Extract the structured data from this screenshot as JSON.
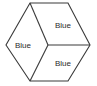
{
  "diagram": {
    "name": "hexagon-three-rhombi",
    "canvas": {
      "width": 97,
      "height": 86
    },
    "background_color": "#ffffff",
    "stroke_color": "#3a3a3a",
    "text_color": "#2b2b2b",
    "outline": {
      "points": "30,3 68,3 90,45 68,81 30,81 6,45",
      "vertices": [
        {
          "name": "top-left",
          "x": 30,
          "y": 3
        },
        {
          "name": "top-right",
          "x": 68,
          "y": 3
        },
        {
          "name": "right",
          "x": 90,
          "y": 45
        },
        {
          "name": "bottom-right",
          "x": 68,
          "y": 81
        },
        {
          "name": "bottom-left",
          "x": 30,
          "y": 81
        },
        {
          "name": "left",
          "x": 6,
          "y": 45
        }
      ]
    },
    "center": {
      "x": 48,
      "y": 45
    },
    "dividers": [
      {
        "name": "divider-top-left-to-center",
        "x1": 30,
        "y1": 3,
        "x2": 48,
        "y2": 45
      },
      {
        "name": "divider-bottom-left-to-center",
        "x1": 30,
        "y1": 81,
        "x2": 48,
        "y2": 45
      },
      {
        "name": "divider-center-to-right",
        "x1": 48,
        "y1": 45,
        "x2": 90,
        "y2": 45
      }
    ],
    "regions": [
      {
        "id": "left",
        "label": "Blue",
        "label_x": 23,
        "label_y": 45
      },
      {
        "id": "top-right",
        "label": "Blue",
        "label_x": 63,
        "label_y": 25
      },
      {
        "id": "bottom-right",
        "label": "Blue",
        "label_x": 63,
        "label_y": 63
      }
    ]
  }
}
